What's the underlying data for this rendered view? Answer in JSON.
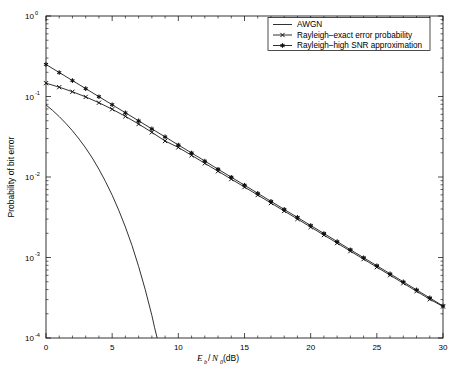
{
  "chart_data": {
    "type": "line",
    "title": "",
    "subtitle": "",
    "xlabel": "Eb/N0 (dB)",
    "xlabel_parts": {
      "e": "E",
      "b": "b",
      "slash": "/",
      "n": "N",
      "zero": "0",
      "unit": " (dB)"
    },
    "ylabel": "Probability of bit error",
    "yscale": "log",
    "xscale": "linear",
    "xlim": [
      0,
      30
    ],
    "ylim": [
      0.0001,
      1
    ],
    "grid": false,
    "legend_position": "top-right",
    "x_ticks": [
      "0",
      "5",
      "10",
      "15",
      "20",
      "25",
      "30"
    ],
    "x_tick_values": [
      0,
      5,
      10,
      15,
      20,
      25,
      30
    ],
    "y_ticks": [
      {
        "mantissa": "10",
        "exponent": "0",
        "value": 1
      },
      {
        "mantissa": "10",
        "exponent": "-1",
        "value": 0.1
      },
      {
        "mantissa": "10",
        "exponent": "-2",
        "value": 0.01
      },
      {
        "mantissa": "10",
        "exponent": "-3",
        "value": 0.001
      },
      {
        "mantissa": "10",
        "exponent": "-4",
        "value": 0.0001
      }
    ],
    "series": [
      {
        "name": "AWGN",
        "marker": "none",
        "color": "#1a1a1a",
        "x": [
          0,
          0.5,
          1,
          1.5,
          2,
          2.5,
          3,
          3.5,
          4,
          4.5,
          5,
          5.5,
          6,
          6.5,
          7,
          7.5,
          8,
          8.2,
          8.4
        ],
        "values": [
          0.0786,
          0.0671,
          0.0563,
          0.0463,
          0.0375,
          0.0296,
          0.0229,
          0.0172,
          0.0125,
          0.00875,
          0.00595,
          0.00386,
          0.00239,
          0.00141,
          0.000773,
          0.000398,
          0.000191,
          0.000136,
          0.0001
        ]
      },
      {
        "name": "Rayleigh–exact error probability",
        "marker": "x",
        "color": "#1a1a1a",
        "x": [
          0,
          1,
          2,
          3,
          4,
          5,
          6,
          7,
          8,
          9,
          10,
          11,
          12,
          13,
          14,
          15,
          16,
          17,
          18,
          19,
          20,
          21,
          22,
          23,
          24,
          25,
          26,
          27,
          28,
          29,
          30
        ],
        "values": [
          0.1464,
          0.1306,
          0.1146,
          0.0988,
          0.0837,
          0.0695,
          0.0567,
          0.0455,
          0.0359,
          0.028,
          0.0233,
          0.0186,
          0.0148,
          0.0118,
          0.00942,
          0.0075,
          0.00597,
          0.00475,
          0.00378,
          0.00301,
          0.00239,
          0.0019,
          0.00151,
          0.0012,
          0.000954,
          0.000759,
          0.000603,
          0.000479,
          0.000381,
          0.000303,
          0.000246
        ]
      },
      {
        "name": "Rayleigh–high SNR approximation",
        "marker": "star",
        "color": "#1a1a1a",
        "x": [
          0,
          1,
          2,
          3,
          4,
          5,
          6,
          7,
          8,
          9,
          10,
          11,
          12,
          13,
          14,
          15,
          16,
          17,
          18,
          19,
          20,
          21,
          22,
          23,
          24,
          25,
          26,
          27,
          28,
          29,
          30
        ],
        "values": [
          0.25,
          0.1986,
          0.1578,
          0.1253,
          0.0995,
          0.0791,
          0.0628,
          0.0499,
          0.0396,
          0.0315,
          0.025,
          0.0199,
          0.0158,
          0.0125,
          0.00995,
          0.00791,
          0.00628,
          0.00499,
          0.00396,
          0.00315,
          0.0025,
          0.00199,
          0.00158,
          0.00125,
          0.000995,
          0.000791,
          0.000628,
          0.000499,
          0.000396,
          0.000315,
          0.00025
        ]
      }
    ],
    "legend_entries": [
      {
        "label": "AWGN",
        "marker": "none"
      },
      {
        "label": "Rayleigh–exact error probability",
        "marker": "x"
      },
      {
        "label": "Rayleigh–high SNR approximation",
        "marker": "star"
      }
    ]
  },
  "colors": {
    "background": "#ffffff",
    "axis": "#000000",
    "curve": "#1a1a1a"
  }
}
